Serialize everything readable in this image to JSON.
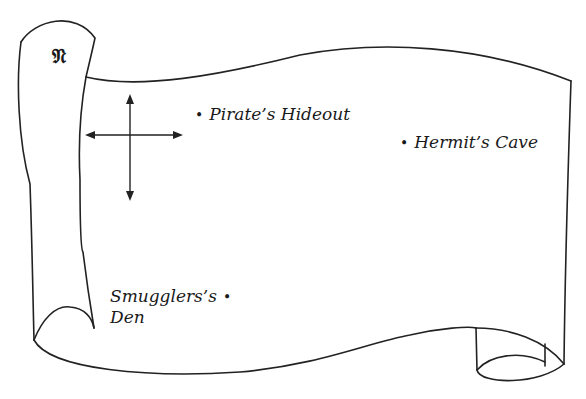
{
  "map": {
    "north_marker": "𝔑",
    "compass": "compass-rose",
    "locations": [
      {
        "name": "Pirate’s Hideout",
        "bullet": "•"
      },
      {
        "name": "Hermit’s Cave",
        "bullet": "•"
      },
      {
        "name_line1": "Smugglers’s",
        "name_line2": "Den",
        "bullet": "•"
      }
    ]
  },
  "colors": {
    "ink": "#1a1a1a",
    "paper": "#ffffff"
  }
}
